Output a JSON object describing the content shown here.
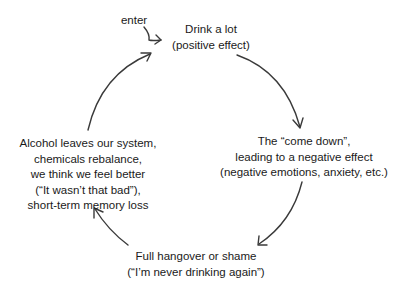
{
  "diagram": {
    "type": "cycle",
    "entry_label": "enter",
    "nodes": [
      {
        "id": "drink",
        "lines": [
          "Drink a lot",
          "(positive effect)"
        ]
      },
      {
        "id": "come-down",
        "lines": [
          "The “come down”,",
          "leading to a negative effect",
          "(negative emotions, anxiety, etc.)"
        ]
      },
      {
        "id": "hangover",
        "lines": [
          "Full hangover or shame",
          "(“I’m never drinking again”)"
        ]
      },
      {
        "id": "rebalance",
        "lines": [
          "Alcohol leaves our system,",
          "chemicals rebalance,",
          "we think we feel better",
          "(“It wasn’t that bad”),",
          "short-term memory loss"
        ]
      }
    ],
    "edges": [
      {
        "from": "enter",
        "to": "drink"
      },
      {
        "from": "drink",
        "to": "come-down"
      },
      {
        "from": "come-down",
        "to": "hangover"
      },
      {
        "from": "hangover",
        "to": "rebalance"
      },
      {
        "from": "rebalance",
        "to": "drink"
      }
    ],
    "colors": {
      "text": "#1a1a1a",
      "arrow": "#3a3a3a",
      "background": "#ffffff"
    }
  }
}
